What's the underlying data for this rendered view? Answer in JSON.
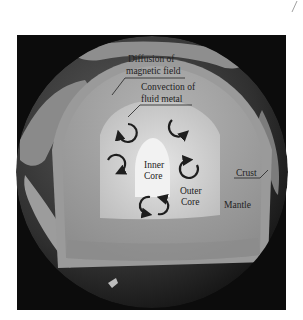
{
  "figure": {
    "colors": {
      "background_frame": "#0c0c0c",
      "ocean": "#3a3a3a",
      "land": "#8c8c8c",
      "crust_band": "#9a9a9a",
      "mantle": "#a8a8a8",
      "outer_core": "#cfcfcf",
      "inner_core": "#f2f2f2",
      "arrow": "#1e1e1e",
      "text": "#222222"
    },
    "labels": {
      "diffusion": [
        "Diffusion of",
        "magnetic field"
      ],
      "convection": [
        "Convection of",
        "fluid metal"
      ],
      "inner_core": [
        "Inner",
        "Core"
      ],
      "outer_core": [
        "Outer",
        "Core"
      ],
      "crust": "Crust",
      "mantle": "Mantle"
    },
    "convection_cells": 6
  }
}
